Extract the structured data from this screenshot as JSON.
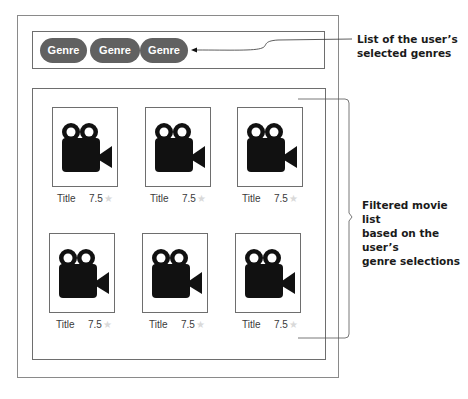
{
  "genres": {
    "items": [
      {
        "label": "Genre 1"
      },
      {
        "label": "Genre 2"
      },
      {
        "label": "Genre 3"
      }
    ]
  },
  "movies": {
    "items": [
      {
        "title": "Title",
        "rating": "7.5",
        "icon": "movie-camera-icon"
      },
      {
        "title": "Title",
        "rating": "7.5",
        "icon": "movie-camera-icon"
      },
      {
        "title": "Title",
        "rating": "7.5",
        "icon": "movie-camera-icon"
      },
      {
        "title": "Title",
        "rating": "7.5",
        "icon": "movie-camera-icon"
      },
      {
        "title": "Title",
        "rating": "7.5",
        "icon": "movie-camera-icon"
      },
      {
        "title": "Title",
        "rating": "7.5",
        "icon": "movie-camera-icon"
      }
    ],
    "star_glyph": "★"
  },
  "annotations": {
    "genres_callout": {
      "line1": "List of the user’s",
      "line2": "selected genres"
    },
    "movies_callout": {
      "line1": "Filtered movie list",
      "line2": "based on the user’s",
      "line3": "genre selections"
    }
  },
  "colors": {
    "pill_bg": "#616161",
    "pill_text": "#ffffff",
    "frame": "#6e6e6e",
    "star": "#d9d9d9",
    "icon": "#111111"
  }
}
